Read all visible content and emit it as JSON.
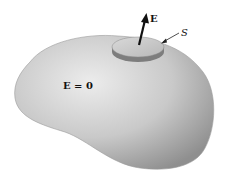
{
  "figure": {
    "type": "conductor-gaussian-pillbox",
    "labels": {
      "field_vector": "E",
      "surface": "S",
      "interior": "E = 0"
    },
    "colors": {
      "background": "#ffffff",
      "conductor_light": "#e8e8e8",
      "conductor_mid": "#bdbdbd",
      "conductor_dark": "#8a8a8a",
      "pillbox_top": "#cfcfcf",
      "pillbox_side": "#7a7a7a",
      "arrow": "#111111"
    }
  }
}
